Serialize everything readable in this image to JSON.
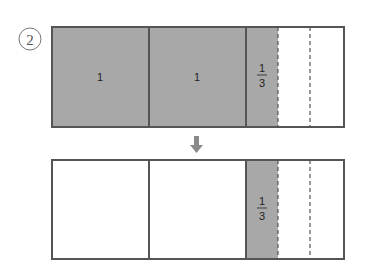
{
  "step_label": "2",
  "colors": {
    "shaded": "#a8a8a8",
    "border": "#555555",
    "arrow": "#8a8a8a",
    "dashed": "#555555"
  },
  "top_bar": {
    "cells": [
      {
        "label": "1",
        "shaded": true
      },
      {
        "label": "1",
        "shaded": true
      },
      {
        "label_num": "1",
        "label_den": "3",
        "shaded": true
      }
    ]
  },
  "bottom_bar": {
    "cells": [
      {
        "label": "",
        "shaded": false
      },
      {
        "label": "",
        "shaded": false
      },
      {
        "label_num": "1",
        "label_den": "3",
        "shaded": true
      }
    ]
  }
}
